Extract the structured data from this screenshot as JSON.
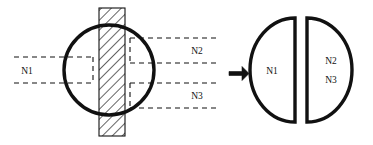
{
  "diagram": {
    "stroke_color": "#111111",
    "hatch_color": "#111111",
    "background": "#ffffff",
    "left_figure": {
      "name": "circle-with-hatched-band",
      "circle": {
        "cx": 109,
        "cy": 70,
        "r": 45,
        "stroke_width": 3.4
      },
      "band": {
        "x": 99,
        "y": 8,
        "width": 26,
        "height": 128,
        "hatch": "diagonal-45",
        "stroke_width": 1.1
      },
      "callouts": [
        {
          "id": "n1",
          "label": "N1",
          "label_x": 27,
          "label_y": 74,
          "box_x": 66,
          "box_y": 57,
          "box_w": 27,
          "box_h": 26,
          "line_y_top": 57,
          "line_y_bottom": 83,
          "line_x_start": 14,
          "line_x_end": 66
        },
        {
          "id": "n2",
          "label": "N2",
          "label_x": 197,
          "label_y": 54,
          "box_x": 130,
          "box_y": 38,
          "box_w": 34,
          "box_h": 25,
          "line_y_top": 38,
          "line_y_bottom": 63,
          "line_x_start": 164,
          "line_x_end": 216
        },
        {
          "id": "n3",
          "label": "N3",
          "label_x": 197,
          "label_y": 99,
          "box_x": 130,
          "box_y": 83,
          "box_w": 34,
          "box_h": 25,
          "line_y_top": 83,
          "line_y_bottom": 108,
          "line_x_start": 164,
          "line_x_end": 216
        }
      ]
    },
    "arrow": {
      "name": "transform-arrow",
      "direction": "right",
      "x": 229,
      "y": 71,
      "length": 18,
      "thickness": 5
    },
    "right_figure": {
      "name": "split-halves",
      "left_half": {
        "label": "N1",
        "flat_edge_x": 295,
        "cx": 295,
        "cy": 70,
        "rx": 45,
        "ry": 52,
        "label_x": 272,
        "label_y": 74,
        "stroke_width": 3.4
      },
      "right_half": {
        "labels": [
          "N2",
          "N3"
        ],
        "flat_edge_x": 307,
        "cx": 307,
        "cy": 70,
        "rx": 45,
        "ry": 52,
        "label_x": 330,
        "label_y_1": 64,
        "label_y_2": 83,
        "stroke_width": 3.4
      }
    }
  }
}
